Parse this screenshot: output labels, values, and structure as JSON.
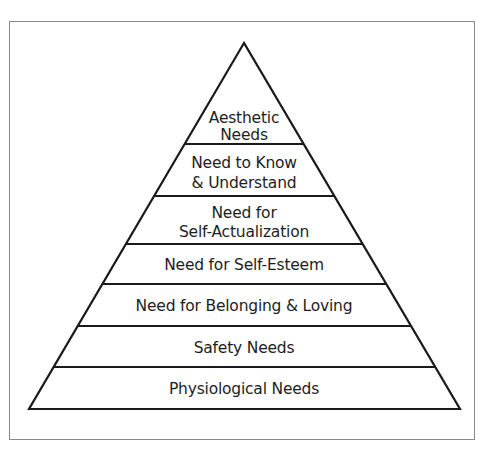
{
  "diagram": {
    "type": "pyramid",
    "title": "",
    "geometry": {
      "apex": [
        244,
        43
      ],
      "base_left": [
        29,
        409
      ],
      "base_right": [
        460,
        409
      ],
      "dividers_y": [
        144,
        196,
        244,
        284,
        326,
        367
      ]
    },
    "colors": {
      "stroke": "#1a1a1a",
      "text": "#1e1e1e",
      "frame": "#8a8a8a",
      "background": "#ffffff"
    },
    "tiers": [
      {
        "level": 7,
        "lines": [
          "Aesthetic",
          "Needs"
        ]
      },
      {
        "level": 6,
        "lines": [
          "Need to Know",
          "& Understand"
        ]
      },
      {
        "level": 5,
        "lines": [
          "Need for",
          "Self-Actualization"
        ]
      },
      {
        "level": 4,
        "lines": [
          "Need for Self-Esteem"
        ]
      },
      {
        "level": 3,
        "lines": [
          "Need for Belonging & Loving"
        ]
      },
      {
        "level": 2,
        "lines": [
          "Safety Needs"
        ]
      },
      {
        "level": 1,
        "lines": [
          "Physiological Needs"
        ]
      }
    ]
  }
}
